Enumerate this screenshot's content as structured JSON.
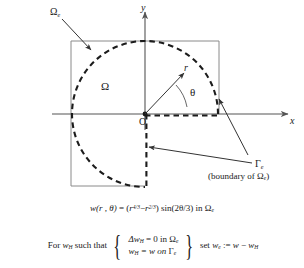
{
  "figure": {
    "type": "geometry-diagram",
    "axes": {
      "x_label": "x",
      "y_label": "y",
      "origin_label": "O"
    },
    "labels": {
      "radius": "r",
      "angle": "θ",
      "domain": "Ω",
      "extended_domain": "Ω",
      "extended_domain_sub": "e",
      "boundary": "Γ",
      "boundary_sub": "e",
      "boundary_caption": "(boundary of Ω"
    },
    "boundary_caption_parts": {
      "open": "(boundary of ",
      "symbol": "Ω",
      "sub": "e",
      "close": ")"
    }
  },
  "formula": {
    "lhs": "w(r , θ)",
    "eq": "=",
    "open_paren": "(",
    "term1_base": "r",
    "term1_exp": "4/3",
    "minus": "−",
    "term2_base": "r",
    "term2_exp": "2/3",
    "close_paren": ")",
    "trig": "sin(2θ/3)",
    "in": "in",
    "domain": "Ω",
    "domain_sub": "e"
  },
  "statement": {
    "prefix": "For",
    "prefix_w": "w",
    "prefix_w_sub": "H",
    "prefix_tail": "such that",
    "cond1": {
      "laplacian": "Δw",
      "laplacian_sub": "H",
      "eq_zero": "= 0 in",
      "domain": "Ω",
      "domain_sub": "e"
    },
    "cond2": {
      "w": "w",
      "w_sub": "H",
      "eq": "= w on",
      "boundary": "Γ",
      "boundary_sub": "e"
    },
    "tail": {
      "set": "set",
      "w": "w",
      "w_sub": "e",
      "assign": ":=",
      "expr_a": "w",
      "minus": "−",
      "expr_b": "w",
      "expr_b_sub": "H"
    }
  },
  "colors": {
    "ink": "#1a1a1a",
    "rect_stroke": "#888888",
    "axis_stroke": "#555555",
    "dash_stroke": "#222222",
    "arrow_stroke": "#333333",
    "background": "#ffffff"
  },
  "geometry": {
    "origin_x": 145,
    "origin_y": 114,
    "radius": 73,
    "rect_left": 71,
    "rect_top": 41,
    "rect_right": 219,
    "rect_bottom": 186
  }
}
